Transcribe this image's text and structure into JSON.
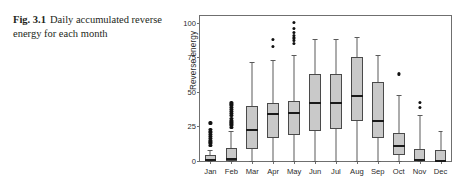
{
  "caption": {
    "fig_label": "Fig. 3.1",
    "text": "Daily accumulated reverse energy for each month"
  },
  "chart_data": {
    "type": "box",
    "title": "",
    "xlabel": "",
    "ylabel": "Reverse energy",
    "ylim": [
      0,
      105
    ],
    "yticks": [
      0,
      25,
      50,
      75,
      100
    ],
    "ytick_labels": [
      "0",
      "25",
      "50",
      "75",
      "100"
    ],
    "grid": false,
    "legend": "none",
    "categories": [
      "Jan",
      "Feb",
      "Mar",
      "Apr",
      "May",
      "Jun",
      "Jul",
      "Aug",
      "Sep",
      "Oct",
      "Nov",
      "Dec"
    ],
    "boxes": [
      {
        "category": "Jan",
        "whisker_low": 0,
        "q1": 0,
        "median": 0.8,
        "q3": 4.5,
        "whisker_high": 8,
        "outliers": [
          11,
          13,
          14.5,
          16,
          17.5,
          19,
          21,
          23,
          27.5
        ]
      },
      {
        "category": "Feb",
        "whisker_low": 0,
        "q1": 0,
        "median": 1.5,
        "q3": 9.5,
        "whisker_high": 22,
        "outliers": [
          24,
          26,
          27.5,
          29,
          31,
          33,
          34.5,
          36,
          37.5,
          39,
          40.5,
          42
        ]
      },
      {
        "category": "Mar",
        "whisker_low": 0,
        "q1": 8.5,
        "median": 22.5,
        "q3": 40,
        "whisker_high": 72,
        "outliers": []
      },
      {
        "category": "Apr",
        "whisker_low": 0,
        "q1": 17,
        "median": 34,
        "q3": 42,
        "whisker_high": 73,
        "outliers": [
          83,
          88
        ]
      },
      {
        "category": "May",
        "whisker_low": 0,
        "q1": 19,
        "median": 34.5,
        "q3": 43.5,
        "whisker_high": 77,
        "outliers": [
          85,
          87,
          89,
          91,
          93,
          96,
          100
        ]
      },
      {
        "category": "Jun",
        "whisker_low": 0,
        "q1": 22,
        "median": 42,
        "q3": 63,
        "whisker_high": 88,
        "outliers": []
      },
      {
        "category": "Jul",
        "whisker_low": 0,
        "q1": 23,
        "median": 42,
        "q3": 63,
        "whisker_high": 88,
        "outliers": []
      },
      {
        "category": "Aug",
        "whisker_low": 0,
        "q1": 29,
        "median": 47,
        "q3": 75,
        "whisker_high": 90,
        "outliers": []
      },
      {
        "category": "Sep",
        "whisker_low": 0,
        "q1": 16.5,
        "median": 29,
        "q3": 57,
        "whisker_high": 77,
        "outliers": []
      },
      {
        "category": "Oct",
        "whisker_low": 0,
        "q1": 4,
        "median": 11,
        "q3": 20,
        "whisker_high": 48,
        "outliers": [
          63
        ]
      },
      {
        "category": "Nov",
        "whisker_low": 0,
        "q1": 0,
        "median": 1,
        "q3": 9,
        "whisker_high": 33,
        "outliers": [
          39,
          42.5
        ]
      },
      {
        "category": "Dec",
        "whisker_low": 0,
        "q1": 0,
        "median": 0,
        "q3": 8,
        "whisker_high": 22,
        "outliers": []
      }
    ]
  },
  "colors": {
    "box_fill": "#c9c9c9",
    "box_edge": "#4a4a4a",
    "median": "#1a1a1a",
    "whisker": "#5a5a5a",
    "outlier": "#111111",
    "frame": "#6f6f6f",
    "text": "#2b2b2b"
  }
}
